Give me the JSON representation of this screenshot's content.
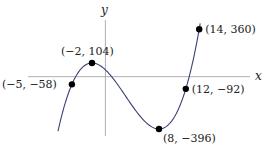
{
  "chart_data": {
    "type": "line",
    "title": "",
    "xlabel": "x",
    "ylabel": "y",
    "function": "f(x) = x^3 - 9x^2 - 48x + 52",
    "x_range": [
      -7.07,
      14.15
    ],
    "grid": false,
    "legend": null,
    "curve_color": "#3a3f7a",
    "axis_color": "#9a9a9a",
    "points": [
      {
        "x": -5,
        "y": -58,
        "label": "(−5, −58)"
      },
      {
        "x": -2,
        "y": 104,
        "label": "(−2, 104)"
      },
      {
        "x": 8,
        "y": -396,
        "label": "(8, −396)"
      },
      {
        "x": 12,
        "y": -92,
        "label": "(12, −92)"
      },
      {
        "x": 14,
        "y": 360,
        "label": "(14, 360)"
      }
    ]
  },
  "axes": {
    "x_label": "x",
    "y_label": "y"
  }
}
